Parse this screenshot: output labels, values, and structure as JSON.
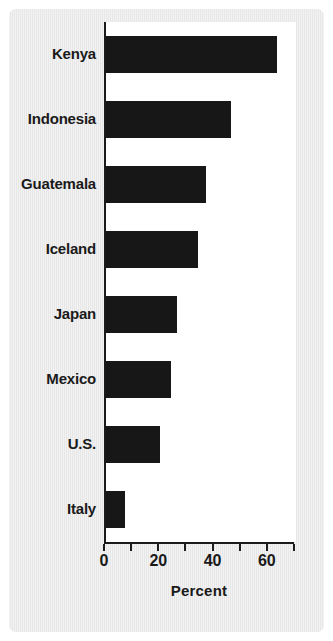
{
  "chart_data": {
    "type": "bar",
    "orientation": "horizontal",
    "title": "",
    "xlabel": "Percent",
    "ylabel": "",
    "xlim": [
      0,
      70
    ],
    "ylim": null,
    "grid": false,
    "legend": null,
    "bar_color": "#171717",
    "plot_background": "#ffffff",
    "figure_background": "#eaeaea",
    "categories": [
      "Kenya",
      "Indonesia",
      "Guatemala",
      "Iceland",
      "Japan",
      "Mexico",
      "U.S.",
      "Italy"
    ],
    "values": [
      63,
      46,
      37,
      34,
      26,
      24,
      20,
      7
    ],
    "xticks": [
      0,
      10,
      20,
      30,
      40,
      50,
      60,
      70
    ],
    "xtick_labels": [
      "0",
      "",
      "20",
      "",
      "40",
      "",
      "60",
      ""
    ],
    "labeled_xticks": [
      {
        "value": 0,
        "label": "0"
      },
      {
        "value": 20,
        "label": "20"
      },
      {
        "value": 40,
        "label": "40"
      },
      {
        "value": 60,
        "label": "60"
      }
    ],
    "bars": [
      {
        "category": "Kenya",
        "value": 63
      },
      {
        "category": "Indonesia",
        "value": 46
      },
      {
        "category": "Guatemala",
        "value": 37
      },
      {
        "category": "Iceland",
        "value": 34
      },
      {
        "category": "Japan",
        "value": 26
      },
      {
        "category": "Mexico",
        "value": 24
      },
      {
        "category": "U.S.",
        "value": 20
      },
      {
        "category": "Italy",
        "value": 7
      }
    ]
  }
}
